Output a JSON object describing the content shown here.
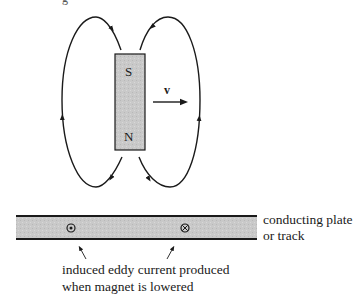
{
  "figure": {
    "top_fragment": "g",
    "magnet": {
      "top_pole": "S",
      "bottom_pole": "N",
      "fill": "#c4c4c4"
    },
    "velocity": {
      "label": "v"
    },
    "plate": {
      "fill": "#cdcdcd",
      "label_line1": "conducting plate",
      "label_line2": "or track",
      "symbols": [
        {
          "type": "dot",
          "meaning": "current out of page",
          "glyph": "⊙"
        },
        {
          "type": "cross",
          "meaning": "current into page",
          "glyph": "⊗"
        }
      ]
    },
    "caption": {
      "line1": "induced eddy current produced",
      "line2": "when magnet is lowered"
    },
    "colors": {
      "ink": "#1a1a1a",
      "background": "#ffffff"
    }
  }
}
